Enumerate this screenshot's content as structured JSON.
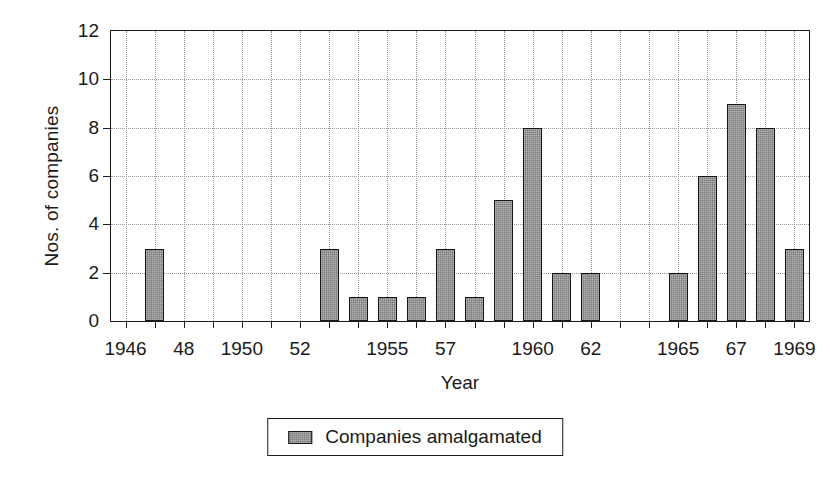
{
  "chart_data": {
    "type": "bar",
    "title": "",
    "xlabel": "Year",
    "ylabel": "Nos. of companies",
    "ylim": [
      0,
      12
    ],
    "yticks": [
      0,
      2,
      4,
      6,
      8,
      10,
      12
    ],
    "ytick_labels": [
      "0",
      "2",
      "4",
      "6",
      "8",
      "10",
      "12"
    ],
    "grid": true,
    "legend_position": "bottom-center",
    "legend": [
      "Companies amalgamated"
    ],
    "categories": [
      "1946",
      "1947",
      "1948",
      "1949",
      "1950",
      "1951",
      "1952",
      "1953",
      "1954",
      "1955",
      "1956",
      "1957",
      "1958",
      "1959",
      "1960",
      "1961",
      "1962",
      "1963",
      "1964",
      "1965",
      "1966",
      "1967",
      "1968",
      "1969"
    ],
    "xtick_labels": [
      {
        "category": "1946",
        "text": "1946"
      },
      {
        "category": "1948",
        "text": "48"
      },
      {
        "category": "1950",
        "text": "1950"
      },
      {
        "category": "1952",
        "text": "52"
      },
      {
        "category": "1955",
        "text": "1955"
      },
      {
        "category": "1957",
        "text": "57"
      },
      {
        "category": "1960",
        "text": "1960"
      },
      {
        "category": "1962",
        "text": "62"
      },
      {
        "category": "1965",
        "text": "1965"
      },
      {
        "category": "1967",
        "text": "67"
      },
      {
        "category": "1969",
        "text": "1969"
      }
    ],
    "series": [
      {
        "name": "Companies amalgamated",
        "color": "#7b7b7b",
        "values": [
          0,
          3,
          0,
          0,
          0,
          0,
          0,
          3,
          1,
          1,
          1,
          3,
          1,
          5,
          8,
          2,
          2,
          0,
          0,
          2,
          6,
          9,
          8,
          3
        ]
      }
    ]
  },
  "colors": {
    "bar_fill": "#7b7b7b",
    "bar_edge": "#161616",
    "axis": "#1c1c1c",
    "grid": "#9a9a9a",
    "background": "#ffffff"
  }
}
